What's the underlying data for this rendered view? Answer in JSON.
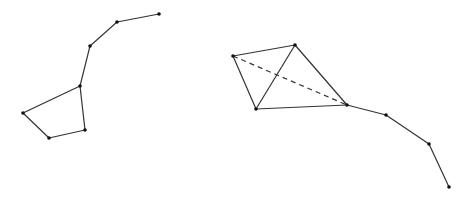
{
  "diagram": {
    "type": "graph",
    "colors": {
      "edge": "#333333",
      "vertex": "#111111",
      "background": "#ffffff"
    },
    "figures": [
      {
        "name": "left-figure",
        "vertices": [
          {
            "id": "L1",
            "x": 159,
            "y": 14
          },
          {
            "id": "L2",
            "x": 117,
            "y": 22
          },
          {
            "id": "L3",
            "x": 90,
            "y": 46
          },
          {
            "id": "L4",
            "x": 80,
            "y": 86
          },
          {
            "id": "L5",
            "x": 23,
            "y": 113
          },
          {
            "id": "L6",
            "x": 49,
            "y": 138
          },
          {
            "id": "L7",
            "x": 85,
            "y": 130
          }
        ],
        "edges": [
          {
            "from": "L1",
            "to": "L2",
            "style": "solid"
          },
          {
            "from": "L2",
            "to": "L3",
            "style": "solid"
          },
          {
            "from": "L3",
            "to": "L4",
            "style": "solid"
          },
          {
            "from": "L4",
            "to": "L5",
            "style": "solid"
          },
          {
            "from": "L5",
            "to": "L6",
            "style": "solid"
          },
          {
            "from": "L6",
            "to": "L7",
            "style": "solid"
          },
          {
            "from": "L7",
            "to": "L4",
            "style": "solid"
          }
        ]
      },
      {
        "name": "right-figure",
        "vertices": [
          {
            "id": "R1",
            "x": 233,
            "y": 56
          },
          {
            "id": "R2",
            "x": 295,
            "y": 45
          },
          {
            "id": "R3",
            "x": 256,
            "y": 109
          },
          {
            "id": "R4",
            "x": 347,
            "y": 105
          },
          {
            "id": "R5",
            "x": 386,
            "y": 115
          },
          {
            "id": "R6",
            "x": 429,
            "y": 144
          },
          {
            "id": "R7",
            "x": 449,
            "y": 187
          }
        ],
        "edges": [
          {
            "from": "R1",
            "to": "R2",
            "style": "solid"
          },
          {
            "from": "R1",
            "to": "R3",
            "style": "solid"
          },
          {
            "from": "R2",
            "to": "R3",
            "style": "solid"
          },
          {
            "from": "R2",
            "to": "R4",
            "style": "solid"
          },
          {
            "from": "R3",
            "to": "R4",
            "style": "solid"
          },
          {
            "from": "R1",
            "to": "R4",
            "style": "dashed"
          },
          {
            "from": "R4",
            "to": "R5",
            "style": "solid"
          },
          {
            "from": "R5",
            "to": "R6",
            "style": "solid"
          },
          {
            "from": "R6",
            "to": "R7",
            "style": "solid"
          }
        ]
      }
    ]
  }
}
